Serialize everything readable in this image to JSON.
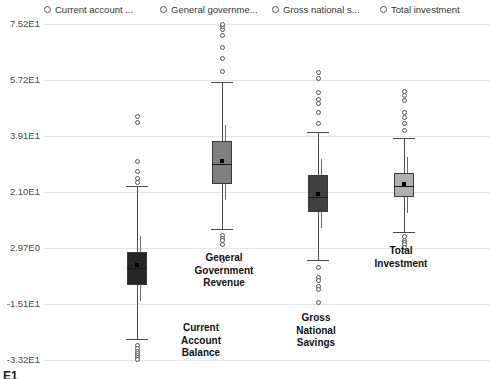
{
  "legend": {
    "position": "top",
    "items": [
      {
        "label": "Current account ...",
        "x": 44,
        "marker": "open-circle"
      },
      {
        "label": "General governme...",
        "x": 160,
        "marker": "open-circle"
      },
      {
        "label": "Gross national s...",
        "x": 272,
        "marker": "open-circle"
      },
      {
        "label": "Total investment",
        "x": 380,
        "marker": "open-circle"
      }
    ]
  },
  "axis": {
    "y_ticks": [
      {
        "label": "7.52E1",
        "value": 75.2,
        "y": 24
      },
      {
        "label": "5.72E1",
        "value": 57.2,
        "y": 80
      },
      {
        "label": "3.91E1",
        "value": 39.1,
        "y": 136
      },
      {
        "label": "2.10E1",
        "value": 21.0,
        "y": 192
      },
      {
        "label": "2.97E0",
        "value": 2.97,
        "y": 248
      },
      {
        "label": "-1.51E1",
        "value": -15.1,
        "y": 304
      },
      {
        "label": "-3.32E1",
        "value": -33.2,
        "y": 360
      }
    ]
  },
  "categories": [
    {
      "key": "current-account-balance",
      "label": "Current\nAccount\nBalance",
      "label_x": 155,
      "label_y": 322,
      "center": 137
    },
    {
      "key": "general-government-revenue",
      "label": "General\nGovernment\nRevenue",
      "label_x": 178,
      "label_y": 252,
      "center": 222
    },
    {
      "key": "gross-national-savings",
      "label": "Gross\nNational\nSavings",
      "label_x": 270,
      "label_y": 312,
      "center": 318
    },
    {
      "key": "total-investment",
      "label": "Total\nInvestment",
      "label_x": 355,
      "label_y": 245,
      "center": 404
    }
  ],
  "bottom_artifact": "E1",
  "chart_data": {
    "type": "box",
    "title": "",
    "xlabel": "",
    "ylabel": "",
    "ylim": [
      -33.2,
      75.2
    ],
    "grid": true,
    "legend_position": "top",
    "series": [
      {
        "name": "Current account balance",
        "short_label": "Current account ...",
        "category": "Current Account Balance",
        "color": "#262626",
        "whisker_low": -26.5,
        "q1": -9.0,
        "median": -3.6,
        "mean": -2.6,
        "q3": 1.8,
        "whisker_high": 23.0,
        "outliers": [
          31.0,
          27.5,
          25.5,
          24.0,
          45.5,
          43.5,
          -28.5,
          -29.5,
          -30.3,
          -31.0,
          -31.8,
          -32.4,
          -33.0
        ]
      },
      {
        "name": "General government revenue",
        "short_label": "General governme...",
        "category": "General Government Revenue",
        "color": "#808080",
        "whisker_low": 9.0,
        "q1": 23.5,
        "median": 30.0,
        "mean": 31.0,
        "q3": 37.5,
        "whisker_high": 56.5,
        "outliers": [
          60.0,
          64.0,
          67.5,
          71.5,
          73.5,
          74.5,
          75.2,
          7.0,
          6.0,
          5.2,
          4.2,
          -1.0
        ]
      },
      {
        "name": "Gross national savings",
        "short_label": "Gross national s...",
        "category": "Gross National Savings",
        "color": "#404040",
        "whisker_low": -1.0,
        "q1": 14.5,
        "median": 19.5,
        "mean": 20.5,
        "q3": 26.5,
        "whisker_high": 40.5,
        "outliers": [
          43.0,
          46.5,
          49.5,
          51.0,
          53.0,
          57.5,
          59.5,
          -3.5,
          -6.5,
          -7.5,
          -9.5,
          -10.5,
          -14.5
        ]
      },
      {
        "name": "Total investment",
        "short_label": "Total investment",
        "category": "Total Investment",
        "color": "#b0b0b0",
        "whisker_low": 8.0,
        "q1": 19.5,
        "median": 23.0,
        "mean": 23.5,
        "q3": 27.0,
        "whisker_high": 38.5,
        "outliers": [
          41.0,
          43.0,
          45.0,
          46.5,
          50.5,
          52.0,
          53.5,
          6.5,
          5.5,
          4.8,
          4.0,
          3.2
        ]
      }
    ]
  }
}
